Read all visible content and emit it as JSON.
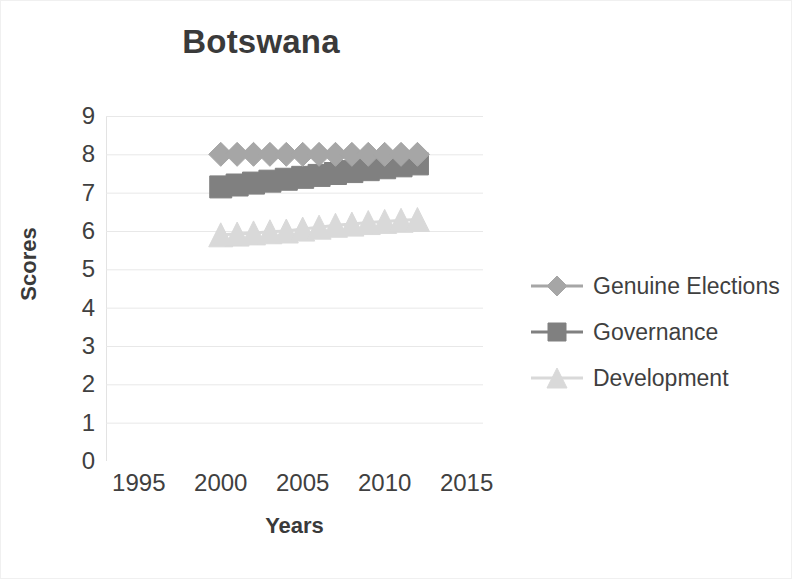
{
  "chart_data": {
    "type": "line",
    "title": "Botswana",
    "xlabel": "Years",
    "ylabel": "Scores",
    "xlim": [
      1993,
      2016
    ],
    "ylim": [
      0,
      9
    ],
    "x_ticks": [
      1995,
      2000,
      2005,
      2010,
      2015
    ],
    "y_ticks": [
      0,
      1,
      2,
      3,
      4,
      5,
      6,
      7,
      8,
      9
    ],
    "grid": "horizontal",
    "legend_position": "right",
    "x": [
      2000,
      2001,
      2002,
      2003,
      2004,
      2005,
      2006,
      2007,
      2008,
      2009,
      2010,
      2011,
      2012
    ],
    "series": [
      {
        "name": "Genuine Elections",
        "marker": "diamond",
        "color": "#a6a6a6",
        "values": [
          8.0,
          8.0,
          8.0,
          8.0,
          8.0,
          8.0,
          8.0,
          8.0,
          8.0,
          8.0,
          8.0,
          8.0,
          8.0
        ]
      },
      {
        "name": "Governance",
        "marker": "square",
        "color": "#808080",
        "values": [
          7.15,
          7.2,
          7.25,
          7.3,
          7.35,
          7.4,
          7.45,
          7.5,
          7.55,
          7.6,
          7.65,
          7.7,
          7.75
        ]
      },
      {
        "name": "Development",
        "marker": "triangle",
        "color": "#d9d9d9",
        "values": [
          5.9,
          5.92,
          5.95,
          5.98,
          6.0,
          6.05,
          6.1,
          6.15,
          6.18,
          6.22,
          6.25,
          6.28,
          6.3
        ]
      }
    ]
  },
  "legend": {
    "entries": [
      {
        "label": "Genuine Elections",
        "marker": "diamond-marker-icon",
        "color": "#a6a6a6"
      },
      {
        "label": "Governance",
        "marker": "square-marker-icon",
        "color": "#808080"
      },
      {
        "label": "Development",
        "marker": "triangle-marker-icon",
        "color": "#d9d9d9"
      }
    ]
  },
  "colors": {
    "title": "#3a3a3a",
    "tick_label": "#404040",
    "gridline": "#e8e8e8",
    "background": "#ffffff"
  }
}
